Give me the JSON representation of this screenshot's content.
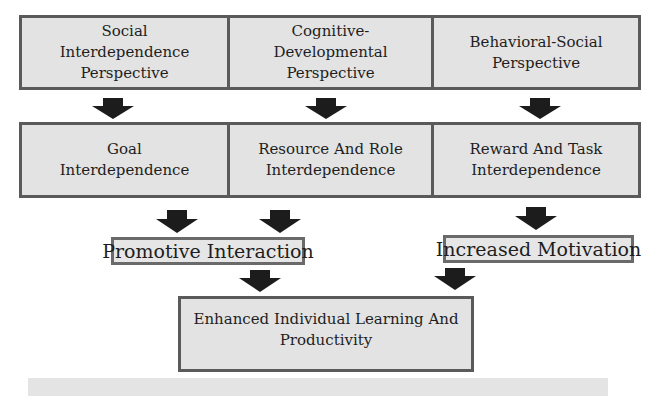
{
  "diagram": {
    "perspectives": [
      {
        "label": "Social Interdependence Perspective"
      },
      {
        "label": "Cognitive-Developmental Perspective"
      },
      {
        "label": "Behavioral-Social Perspective"
      }
    ],
    "interdependences": [
      {
        "label": "Goal Interdependence"
      },
      {
        "label": "Resource And Role Interdependence"
      },
      {
        "label": "Reward And Task Interdependence"
      }
    ],
    "intermediate": [
      {
        "label": "Promotive Interaction"
      },
      {
        "label": "Increased Motivation"
      }
    ],
    "outcome": {
      "label": "Enhanced Individual Learning And Productivity"
    },
    "arrows": [
      {
        "from": "Social Interdependence Perspective",
        "to": "Goal Interdependence"
      },
      {
        "from": "Cognitive-Developmental Perspective",
        "to": "Resource And Role Interdependence"
      },
      {
        "from": "Behavioral-Social Perspective",
        "to": "Reward And Task Interdependence"
      },
      {
        "from": "Goal Interdependence",
        "to": "Promotive Interaction"
      },
      {
        "from": "Resource And Role Interdependence",
        "to": "Promotive Interaction"
      },
      {
        "from": "Reward And Task Interdependence",
        "to": "Increased Motivation"
      },
      {
        "from": "Promotive Interaction",
        "to": "Enhanced Individual Learning And Productivity"
      },
      {
        "from": "Increased Motivation",
        "to": "Enhanced Individual Learning And Productivity"
      }
    ],
    "colors": {
      "box_fill": "#e3e3e3",
      "box_border": "#5a5a5a",
      "arrow": "#1c1c1c",
      "text": "#1e1e1e"
    }
  }
}
